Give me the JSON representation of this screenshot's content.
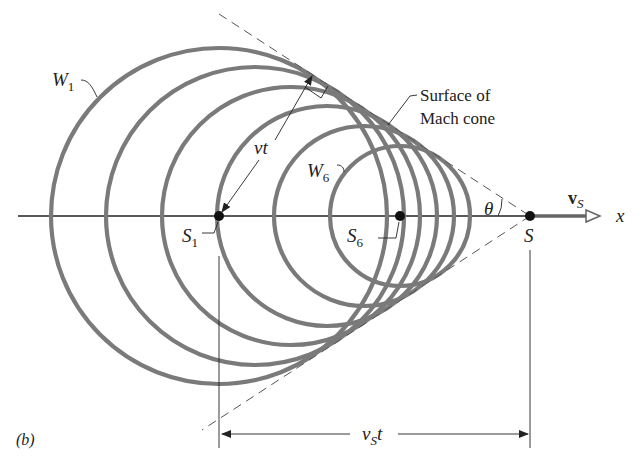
{
  "figure": {
    "panel_label": "(b)"
  },
  "labels": {
    "w1": {
      "main": "W",
      "sub": "1"
    },
    "w6": {
      "main": "W",
      "sub": "6"
    },
    "s1": {
      "main": "S",
      "sub": "1"
    },
    "s6": {
      "main": "S",
      "sub": "6"
    },
    "s": "S",
    "vt": "vt",
    "theta": "θ",
    "vs": {
      "main": "v",
      "sub": "S"
    },
    "x_axis": "x",
    "mach_line1": "Surface of",
    "mach_line2": "Mach cone",
    "vst": {
      "main": "v",
      "sub": "S",
      "tail": "t"
    }
  },
  "geometry": {
    "axis_y": 216,
    "source_S": {
      "x": 530,
      "y": 216
    },
    "wavefronts": [
      {
        "name": "W1",
        "cx": 219,
        "r": 170
      },
      {
        "name": "W2",
        "cx": 255,
        "r": 150
      },
      {
        "name": "W3",
        "cx": 291,
        "r": 130
      },
      {
        "name": "W4",
        "cx": 327,
        "r": 110
      },
      {
        "name": "W5",
        "cx": 364,
        "r": 90
      },
      {
        "name": "W6",
        "cx": 400,
        "r": 70
      }
    ],
    "half_angle_deg": 33
  },
  "colors": {
    "wave": "#7a7a7a",
    "line": "#222222",
    "background": "#ffffff"
  }
}
